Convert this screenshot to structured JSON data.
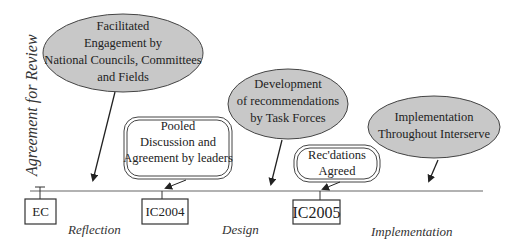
{
  "diagram": {
    "vertical_label": "Agreement for Review",
    "colors": {
      "ellipse_fill": "#c8c8c8",
      "stroke": "#333333",
      "background": "#ffffff"
    },
    "ellipses": [
      {
        "lines": [
          "Facilitated",
          "Engagement by",
          "National Councils, Committees",
          "and Fields"
        ]
      },
      {
        "lines": [
          "Development",
          "of recommendations",
          "by Task Forces"
        ]
      },
      {
        "lines": [
          "Implementation",
          "Throughout Interserve"
        ]
      }
    ],
    "rounded_boxes": [
      {
        "lines": [
          "Pooled",
          "Discussion and",
          "Agreement by leaders"
        ]
      },
      {
        "lines": [
          "Rec'dations",
          "Agreed"
        ]
      }
    ],
    "milestones": [
      {
        "label": "EC"
      },
      {
        "label": "IC2004"
      },
      {
        "label": "IC2005"
      }
    ],
    "phases": [
      {
        "label": "Reflection"
      },
      {
        "label": "Design"
      },
      {
        "label": "Implementation"
      }
    ]
  }
}
